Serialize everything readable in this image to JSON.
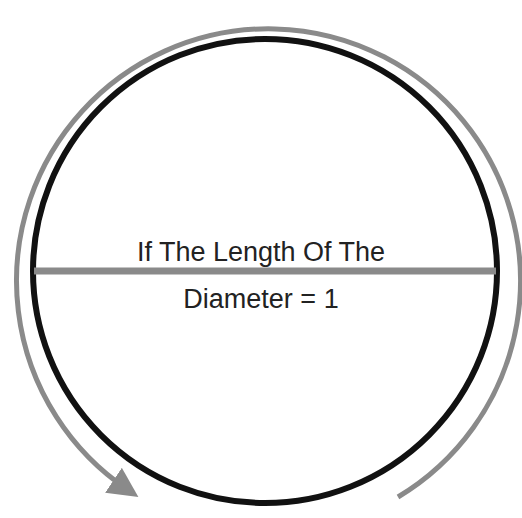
{
  "diagram": {
    "label_line1": "If The Length Of The",
    "label_line2": "Diameter = 1",
    "colors": {
      "circle": "#111111",
      "diameter": "#8a8a8a",
      "circumference_arrow": "#8a8a8a",
      "text": "#222222",
      "background": "#ffffff"
    },
    "circle": {
      "cx": 265,
      "cy": 271,
      "r": 232
    },
    "diameter": {
      "x1": 33,
      "y1": 271,
      "x2": 497,
      "y2": 271
    },
    "arrow_arc": {
      "cx": 264,
      "cy": 270,
      "r": 252,
      "direction": "counterclockwise",
      "has_arrowhead": true
    }
  }
}
